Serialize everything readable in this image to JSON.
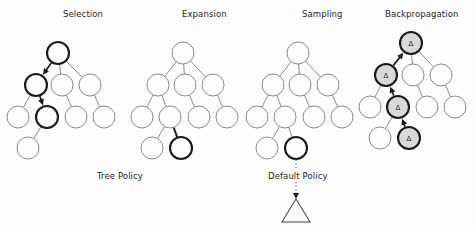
{
  "figure": {
    "width": 475,
    "height": 230,
    "background_color": "#fdfdfd"
  },
  "colors": {
    "node_stroke": "#7d7d7d",
    "node_fill": "#fdfdfd",
    "highlight_stroke": "#1a1a1a",
    "delta_fill": "#d9d9d9",
    "text": "#262626",
    "edge": "#7d7d7d"
  },
  "panels": [
    {
      "id": "selection",
      "title": "Selection",
      "title_x": 63,
      "title_y": 9,
      "origin_x": 0,
      "origin_y": 0,
      "node_radius": 11,
      "nodes": [
        {
          "id": "n0",
          "x": 58,
          "y": 53,
          "style": "bold",
          "label": ""
        },
        {
          "id": "n1",
          "x": 36,
          "y": 85,
          "style": "bold",
          "label": ""
        },
        {
          "id": "n2",
          "x": 62,
          "y": 85,
          "style": "plain",
          "label": ""
        },
        {
          "id": "n3",
          "x": 90,
          "y": 85,
          "style": "plain",
          "label": ""
        },
        {
          "id": "n4",
          "x": 18,
          "y": 117,
          "style": "plain",
          "label": ""
        },
        {
          "id": "n5",
          "x": 47,
          "y": 117,
          "style": "bold",
          "label": ""
        },
        {
          "id": "n6",
          "x": 76,
          "y": 117,
          "style": "plain",
          "label": ""
        },
        {
          "id": "n7",
          "x": 104,
          "y": 117,
          "style": "plain",
          "label": ""
        },
        {
          "id": "n8",
          "x": 28,
          "y": 148,
          "style": "plain",
          "label": ""
        }
      ],
      "edges": [
        {
          "from": "n0",
          "to": "n1",
          "style": "plain"
        },
        {
          "from": "n0",
          "to": "n2",
          "style": "plain"
        },
        {
          "from": "n0",
          "to": "n3",
          "style": "plain"
        },
        {
          "from": "n1",
          "to": "n4",
          "style": "plain"
        },
        {
          "from": "n1",
          "to": "n5",
          "style": "plain"
        },
        {
          "from": "n2",
          "to": "n6",
          "style": "plain"
        },
        {
          "from": "n3",
          "to": "n7",
          "style": "plain"
        },
        {
          "from": "n5",
          "to": "n8",
          "style": "plain"
        }
      ],
      "arrows": [
        {
          "from": "n0",
          "to": "n1"
        },
        {
          "from": "n1",
          "to": "n5"
        }
      ]
    },
    {
      "id": "expansion",
      "title": "Expansion",
      "title_x": 182,
      "title_y": 9,
      "origin_x": 0,
      "origin_y": 0,
      "node_radius": 11,
      "nodes": [
        {
          "id": "n0",
          "x": 183,
          "y": 53,
          "style": "plain",
          "label": ""
        },
        {
          "id": "n1",
          "x": 158,
          "y": 85,
          "style": "plain",
          "label": ""
        },
        {
          "id": "n2",
          "x": 185,
          "y": 85,
          "style": "plain",
          "label": ""
        },
        {
          "id": "n3",
          "x": 213,
          "y": 85,
          "style": "plain",
          "label": ""
        },
        {
          "id": "n4",
          "x": 142,
          "y": 117,
          "style": "plain",
          "label": ""
        },
        {
          "id": "n5",
          "x": 170,
          "y": 117,
          "style": "plain",
          "label": ""
        },
        {
          "id": "n6",
          "x": 199,
          "y": 117,
          "style": "plain",
          "label": ""
        },
        {
          "id": "n7",
          "x": 227,
          "y": 117,
          "style": "plain",
          "label": ""
        },
        {
          "id": "n8",
          "x": 152,
          "y": 148,
          "style": "plain",
          "label": ""
        },
        {
          "id": "n9",
          "x": 181,
          "y": 148,
          "style": "bold",
          "label": ""
        }
      ],
      "edges": [
        {
          "from": "n0",
          "to": "n1",
          "style": "plain"
        },
        {
          "from": "n0",
          "to": "n2",
          "style": "plain"
        },
        {
          "from": "n0",
          "to": "n3",
          "style": "plain"
        },
        {
          "from": "n1",
          "to": "n4",
          "style": "plain"
        },
        {
          "from": "n1",
          "to": "n5",
          "style": "plain"
        },
        {
          "from": "n2",
          "to": "n6",
          "style": "plain"
        },
        {
          "from": "n3",
          "to": "n7",
          "style": "plain"
        },
        {
          "from": "n5",
          "to": "n8",
          "style": "plain"
        },
        {
          "from": "n5",
          "to": "n9",
          "style": "bold"
        }
      ],
      "arrows": []
    },
    {
      "id": "sampling",
      "title": "Sampling",
      "title_x": 302,
      "title_y": 9,
      "origin_x": 0,
      "origin_y": 0,
      "node_radius": 11,
      "nodes": [
        {
          "id": "n0",
          "x": 298,
          "y": 53,
          "style": "plain",
          "label": ""
        },
        {
          "id": "n1",
          "x": 273,
          "y": 85,
          "style": "plain",
          "label": ""
        },
        {
          "id": "n2",
          "x": 300,
          "y": 85,
          "style": "plain",
          "label": ""
        },
        {
          "id": "n3",
          "x": 328,
          "y": 85,
          "style": "plain",
          "label": ""
        },
        {
          "id": "n4",
          "x": 257,
          "y": 117,
          "style": "plain",
          "label": ""
        },
        {
          "id": "n5",
          "x": 285,
          "y": 117,
          "style": "plain",
          "label": ""
        },
        {
          "id": "n6",
          "x": 314,
          "y": 117,
          "style": "plain",
          "label": ""
        },
        {
          "id": "n7",
          "x": 342,
          "y": 117,
          "style": "plain",
          "label": ""
        },
        {
          "id": "n8",
          "x": 267,
          "y": 148,
          "style": "plain",
          "label": ""
        },
        {
          "id": "n9",
          "x": 296,
          "y": 148,
          "style": "bold",
          "label": ""
        }
      ],
      "edges": [
        {
          "from": "n0",
          "to": "n1",
          "style": "plain"
        },
        {
          "from": "n0",
          "to": "n2",
          "style": "plain"
        },
        {
          "from": "n0",
          "to": "n3",
          "style": "plain"
        },
        {
          "from": "n1",
          "to": "n4",
          "style": "plain"
        },
        {
          "from": "n1",
          "to": "n5",
          "style": "plain"
        },
        {
          "from": "n2",
          "to": "n6",
          "style": "plain"
        },
        {
          "from": "n3",
          "to": "n7",
          "style": "plain"
        },
        {
          "from": "n5",
          "to": "n8",
          "style": "plain"
        },
        {
          "from": "n5",
          "to": "n9",
          "style": "plain"
        }
      ],
      "arrows": []
    },
    {
      "id": "backpropagation",
      "title": "Backpropagation",
      "title_x": 385,
      "title_y": 9,
      "origin_x": 0,
      "origin_y": 0,
      "node_radius": 11,
      "nodes": [
        {
          "id": "n0",
          "x": 411,
          "y": 43,
          "style": "delta",
          "label": "Δ"
        },
        {
          "id": "n1",
          "x": 386,
          "y": 75,
          "style": "delta",
          "label": "Δ"
        },
        {
          "id": "n2",
          "x": 413,
          "y": 75,
          "style": "plain",
          "label": ""
        },
        {
          "id": "n3",
          "x": 441,
          "y": 75,
          "style": "plain",
          "label": ""
        },
        {
          "id": "n4",
          "x": 370,
          "y": 107,
          "style": "plain",
          "label": ""
        },
        {
          "id": "n5",
          "x": 398,
          "y": 107,
          "style": "delta",
          "label": "Δ"
        },
        {
          "id": "n6",
          "x": 427,
          "y": 107,
          "style": "plain",
          "label": ""
        },
        {
          "id": "n7",
          "x": 455,
          "y": 107,
          "style": "plain",
          "label": ""
        },
        {
          "id": "n8",
          "x": 380,
          "y": 138,
          "style": "plain",
          "label": ""
        },
        {
          "id": "n9",
          "x": 409,
          "y": 138,
          "style": "delta",
          "label": "Δ"
        }
      ],
      "edges": [
        {
          "from": "n0",
          "to": "n2",
          "style": "plain"
        },
        {
          "from": "n0",
          "to": "n3",
          "style": "plain"
        },
        {
          "from": "n1",
          "to": "n4",
          "style": "plain"
        },
        {
          "from": "n2",
          "to": "n6",
          "style": "plain"
        },
        {
          "from": "n3",
          "to": "n7",
          "style": "plain"
        },
        {
          "from": "n5",
          "to": "n8",
          "style": "plain"
        }
      ],
      "arrows": [
        {
          "from": "n1",
          "to": "n0"
        },
        {
          "from": "n5",
          "to": "n1"
        },
        {
          "from": "n9",
          "to": "n5"
        }
      ]
    }
  ],
  "policy_labels": [
    {
      "id": "tree-policy",
      "text": "Tree Policy",
      "x": 97,
      "y": 171
    },
    {
      "id": "default-policy",
      "text": "Default Policy",
      "x": 268,
      "y": 171
    }
  ],
  "rollout": {
    "dotted_top": {
      "x": 296,
      "y1": 160,
      "y2": 168
    },
    "dotted_bottom": {
      "x": 296,
      "y1": 182,
      "y2": 199
    },
    "triangle": {
      "cx": 296,
      "apex_y": 199,
      "base_y": 222,
      "half_width": 14
    }
  }
}
